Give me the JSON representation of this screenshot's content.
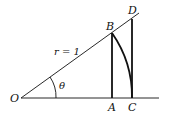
{
  "diagram": {
    "type": "unit-circle-trig-geometry",
    "colors": {
      "stroke": "#111111",
      "background": "#ffffff"
    },
    "points": {
      "O": {
        "label": "O",
        "x": 21,
        "y": 98
      },
      "A": {
        "label": "A",
        "x": 112,
        "y": 98
      },
      "B": {
        "label": "B",
        "x": 112,
        "y": 33
      },
      "C": {
        "label": "C",
        "x": 132,
        "y": 98
      },
      "D": {
        "label": "D",
        "x": 132,
        "y": 19
      }
    },
    "labels": {
      "radius": "r = 1",
      "angle": "θ"
    }
  }
}
